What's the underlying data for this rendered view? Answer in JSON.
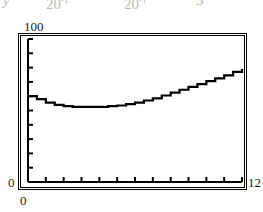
{
  "clipped_header": {
    "fragments": [
      {
        "text": "y",
        "superscript": "",
        "italic": true
      },
      {
        "text": "20",
        "superscript": "-1",
        "italic": false
      },
      {
        "text": "20",
        "superscript": "-1",
        "italic": false
      },
      {
        "text": "3",
        "superscript": "",
        "italic": false
      }
    ]
  },
  "axes": {
    "y_max_label": "100",
    "y_min_label": "0",
    "x_min_label": "0",
    "x_max_label": "12"
  },
  "colors": {
    "ink": "#000000",
    "paper": "#ffffff",
    "faint_ink": "#8f8f8f"
  },
  "chart_data": {
    "type": "line",
    "title": "",
    "xlabel": "",
    "ylabel": "",
    "xlim": [
      0,
      12
    ],
    "ylim": [
      0,
      100
    ],
    "grid": false,
    "legend": null,
    "x_ticks": [
      1,
      2,
      3,
      4,
      5,
      6,
      7,
      8,
      9,
      10,
      11,
      12
    ],
    "y_ticks": [
      10,
      20,
      30,
      40,
      50,
      60,
      70,
      80,
      90,
      100
    ],
    "x_tick_labels": [
      "",
      "",
      "",
      "",
      "",
      "",
      "",
      "",
      "",
      "",
      "",
      ""
    ],
    "y_tick_labels": [
      "",
      "",
      "",
      "",
      "",
      "",
      "",
      "",
      "",
      "",
      "",
      ""
    ],
    "series": [
      {
        "name": "curve",
        "style": "step",
        "x": [
          0.0,
          0.5,
          1.0,
          1.5,
          2.0,
          2.5,
          3.0,
          3.5,
          4.0,
          4.5,
          5.0,
          5.5,
          6.0,
          6.5,
          7.0,
          7.5,
          8.0,
          8.5,
          9.0,
          9.5,
          10.0,
          10.5,
          11.0,
          11.5,
          12.0
        ],
        "y": [
          60.0,
          58.0,
          55.5,
          54.0,
          53.0,
          52.5,
          52.5,
          52.5,
          52.5,
          53.0,
          53.5,
          54.5,
          55.5,
          57.0,
          58.5,
          60.5,
          62.5,
          64.5,
          66.5,
          68.5,
          70.5,
          72.5,
          74.5,
          77.0,
          79.0
        ]
      }
    ]
  }
}
